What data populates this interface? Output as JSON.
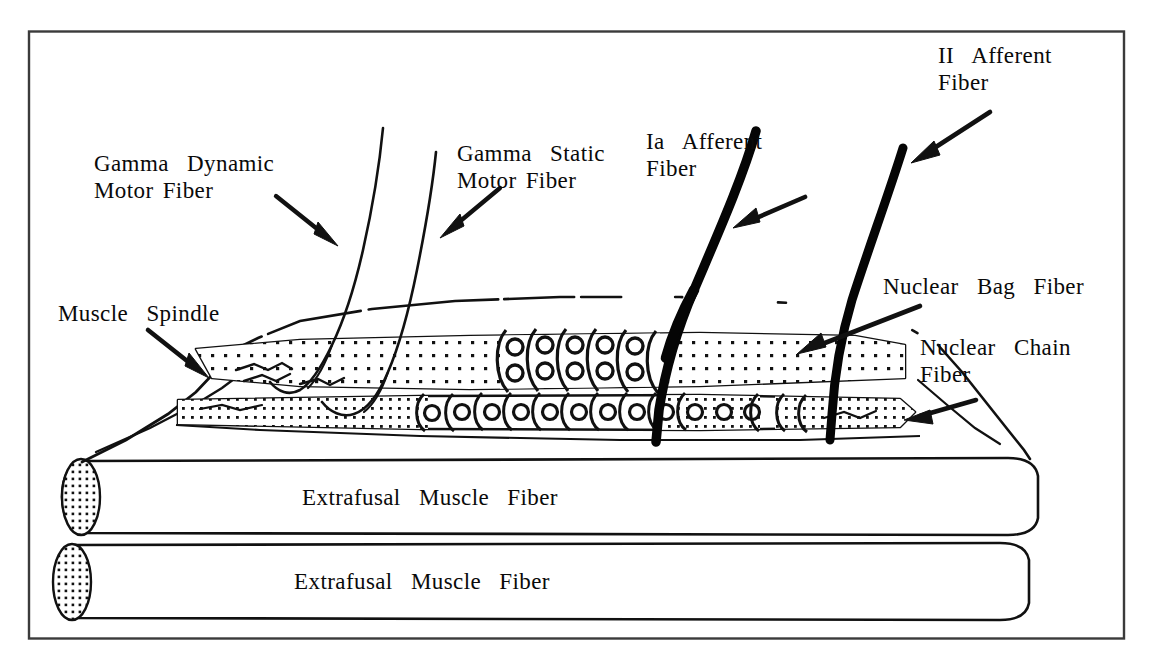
{
  "figure": {
    "border_color": "#3a3a3a",
    "ink_color": "#111111",
    "background": "#ffffff"
  },
  "labels": {
    "gamma_dynamic": "Gamma  Dynamic\nMotor Fiber",
    "gamma_static": "Gamma  Static\nMotor Fiber",
    "ia_afferent": "Ia  Afferent\nFiber",
    "ii_afferent": "II  Afferent\nFiber",
    "muscle_spindle": "Muscle  Spindle",
    "nuclear_bag": "Nuclear  Bag  Fiber",
    "nuclear_chain": "Nuclear  Chain\nFiber",
    "extrafusal_upper": "Extrafusal  Muscle  Fiber",
    "extrafusal_lower": "Extrafusal  Muscle  Fiber"
  },
  "parts": {
    "spindle_capsule": "muscle-spindle-capsule",
    "bag_fiber": "nuclear-bag-fiber",
    "chain_fiber": "nuclear-chain-fiber",
    "ia_fiber": "ia-afferent-fiber",
    "ii_fiber": "ii-afferent-fiber",
    "gamma_dynamic_fiber": "gamma-dynamic-motor-fiber",
    "gamma_static_fiber": "gamma-static-motor-fiber",
    "extrafusal_1": "extrafusal-muscle-fiber-upper",
    "extrafusal_2": "extrafusal-muscle-fiber-lower"
  }
}
